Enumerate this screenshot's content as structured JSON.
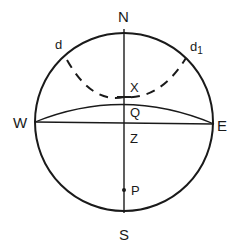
{
  "diagram": {
    "type": "celestial-sphere",
    "colors": {
      "stroke": "#1a1a1a",
      "background": "#ffffff"
    },
    "labels": {
      "north": "N",
      "south": "S",
      "west": "W",
      "east": "E",
      "d": "d",
      "d1": "d",
      "d1_sub": "1",
      "x": "X",
      "q": "Q",
      "z": "Z",
      "p": "P"
    }
  }
}
